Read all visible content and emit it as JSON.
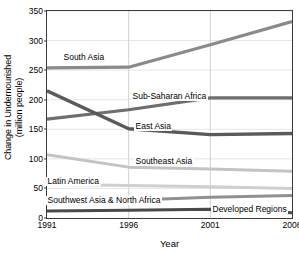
{
  "chart_data": {
    "type": "line",
    "title": "",
    "xlabel": "Year",
    "ylabel": "Change in Undernourished (million people)",
    "ylabel_line1": "Change in Undernourished",
    "ylabel_line2": "(million people)",
    "x": [
      1991,
      1996,
      2001,
      2006
    ],
    "xticklabels": [
      "1991",
      "1996",
      "2001",
      "2006"
    ],
    "yticklabels": [
      "0",
      "50",
      "100",
      "150",
      "200",
      "250",
      "300",
      "350"
    ],
    "yticks": [
      0,
      50,
      100,
      150,
      200,
      250,
      300,
      350
    ],
    "ylim": [
      0,
      350
    ],
    "xlim": [
      1991,
      2006
    ],
    "grid": true,
    "legend": "inline-labels",
    "series": [
      {
        "name": "South Asia",
        "values": [
          254,
          255,
          293,
          332
        ],
        "color": "#8a8a8a",
        "width": 3.2
      },
      {
        "name": "Sub-Saharan Africa",
        "values": [
          167,
          183,
          203,
          203
        ],
        "color": "#6e6e6e",
        "width": 3.2
      },
      {
        "name": "East Asia",
        "values": [
          215,
          151,
          141,
          143
        ],
        "color": "#5a5a5a",
        "width": 3.4
      },
      {
        "name": "Southeast Asia",
        "values": [
          107,
          86,
          83,
          79
        ],
        "color": "#c3c3c3",
        "width": 3.0
      },
      {
        "name": "Latin America",
        "values": [
          57,
          55,
          53,
          50
        ],
        "color": "#cfcfcf",
        "width": 3.0
      },
      {
        "name": "Southwest Asia & North Africa",
        "values": [
          27,
          30,
          35,
          38
        ],
        "color": "#909090",
        "width": 3.0
      },
      {
        "name": "Developed Regions",
        "values": [
          12,
          13,
          15,
          9
        ],
        "color": "#4a4a4a",
        "width": 3.0
      }
    ],
    "series_label_positions": [
      {
        "name": "South Asia",
        "x": 62,
        "y": 53
      },
      {
        "name": "Sub-Saharan Africa",
        "x": 131,
        "y": 92
      },
      {
        "name": "East Asia",
        "x": 134,
        "y": 122
      },
      {
        "name": "Southeast Asia",
        "x": 134,
        "y": 157
      },
      {
        "name": "Latin America",
        "x": 46,
        "y": 177
      },
      {
        "name": "Southwest Asia & North Africa",
        "x": 46,
        "y": 196
      },
      {
        "name": "Developed Regions",
        "x": 211,
        "y": 205
      }
    ],
    "axis_color": "#3a3a3a",
    "grid_color": "#e6e6e6",
    "background": "#ffffff"
  }
}
